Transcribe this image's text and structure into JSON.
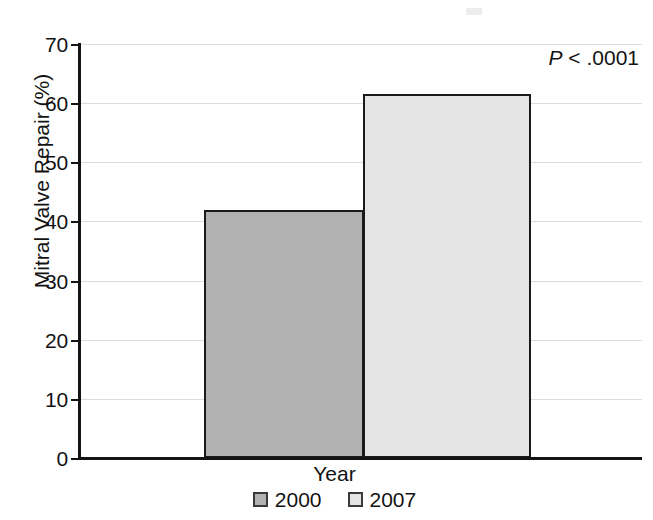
{
  "chart_data": {
    "type": "bar",
    "title": "",
    "subtitle": "",
    "xlabel": "Year",
    "ylabel": "Mitral Valve Repair (%)",
    "categories": [
      "2000",
      "2007"
    ],
    "values": [
      42.0,
      61.6
    ],
    "series": [
      {
        "name": "Year",
        "values": [
          42.0,
          61.6
        ]
      }
    ],
    "ylim": [
      0,
      70
    ],
    "yticks": [
      0,
      10,
      20,
      30,
      40,
      50,
      60,
      70
    ],
    "ytick_labels": [
      "0",
      "10",
      "20",
      "30",
      "40",
      "50",
      "60",
      "70"
    ],
    "xtick_labels": [],
    "grid": "horizontal",
    "legend_position": "bottom-center",
    "legend": [
      {
        "label": "2000",
        "color": "#b1b1b1"
      },
      {
        "label": "2007",
        "color": "#e4e4e4"
      }
    ],
    "annotations": [
      {
        "name": "p-value",
        "prefix": "P",
        "text": " < .0001",
        "full": "P < .0001",
        "position": "top-right"
      }
    ],
    "colors": {
      "bar_2000": "#b1b1b1",
      "bar_2007": "#e4e4e4",
      "bar_outline": "#1a1a1a",
      "axis": "#141414",
      "gridline": "#dcdcdc",
      "text": "#131313",
      "background": "#ffffff"
    }
  }
}
